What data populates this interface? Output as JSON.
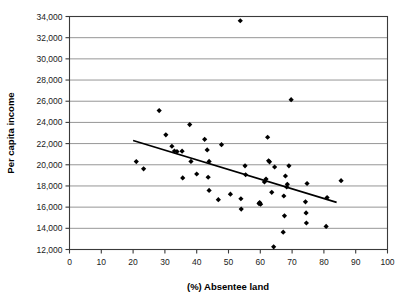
{
  "chart_data": {
    "type": "scatter",
    "title": "",
    "xlabel": "(%) Absentee land",
    "ylabel": "Per capita income",
    "xlim": [
      0,
      100
    ],
    "ylim": [
      12000,
      34000
    ],
    "xticks": [
      0,
      10,
      20,
      30,
      40,
      50,
      60,
      70,
      80,
      90,
      100
    ],
    "yticks": [
      12000,
      14000,
      16000,
      18000,
      20000,
      22000,
      24000,
      26000,
      28000,
      30000,
      32000,
      34000
    ],
    "xtick_labels": [
      "0",
      "10",
      "20",
      "30",
      "40",
      "50",
      "60",
      "70",
      "80",
      "90",
      "100"
    ],
    "ytick_labels": [
      "12,000",
      "14,000",
      "16,000",
      "18,000",
      "20,000",
      "22,000",
      "24,000",
      "26,000",
      "28,000",
      "30,000",
      "32,000",
      "34,000"
    ],
    "grid": "horizontal",
    "legend": "none",
    "marker": "diamond",
    "marker_color": "#000000",
    "points": [
      [
        21.0,
        20300
      ],
      [
        23.3,
        19620
      ],
      [
        28.2,
        25120
      ],
      [
        30.3,
        22830
      ],
      [
        32.2,
        21750
      ],
      [
        33.0,
        21300
      ],
      [
        33.8,
        21250
      ],
      [
        35.4,
        21280
      ],
      [
        35.6,
        18760
      ],
      [
        37.8,
        23800
      ],
      [
        38.2,
        20320
      ],
      [
        40.0,
        19130
      ],
      [
        42.5,
        22400
      ],
      [
        43.3,
        21400
      ],
      [
        43.6,
        18820
      ],
      [
        43.9,
        20320
      ],
      [
        43.9,
        17580
      ],
      [
        46.8,
        16700
      ],
      [
        47.8,
        21900
      ],
      [
        50.6,
        17220
      ],
      [
        53.7,
        33600
      ],
      [
        53.9,
        16790
      ],
      [
        54.0,
        15820
      ],
      [
        55.2,
        19900
      ],
      [
        55.4,
        19060
      ],
      [
        59.6,
        16340
      ],
      [
        59.8,
        16430
      ],
      [
        60.1,
        16280
      ],
      [
        61.3,
        18380
      ],
      [
        61.8,
        18650
      ],
      [
        62.3,
        22600
      ],
      [
        62.6,
        20380
      ],
      [
        62.9,
        20280
      ],
      [
        63.6,
        17400
      ],
      [
        64.2,
        12250
      ],
      [
        64.5,
        19790
      ],
      [
        67.2,
        13640
      ],
      [
        67.4,
        17050
      ],
      [
        67.6,
        15180
      ],
      [
        67.9,
        18940
      ],
      [
        68.3,
        17900
      ],
      [
        68.5,
        18150
      ],
      [
        69.0,
        19900
      ],
      [
        69.7,
        26150
      ],
      [
        74.2,
        16500
      ],
      [
        74.4,
        15450
      ],
      [
        74.5,
        14500
      ],
      [
        74.7,
        18230
      ],
      [
        80.7,
        14180
      ],
      [
        81.0,
        16900
      ],
      [
        85.4,
        18500
      ]
    ],
    "trendline": {
      "x_start": 20.0,
      "y_start": 22300,
      "x_end": 84.0,
      "y_end": 16450
    }
  }
}
